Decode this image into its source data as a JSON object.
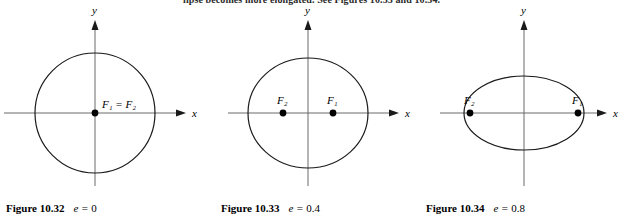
{
  "page": {
    "top_running_text": "lipse becomes more elongated. See Figures 10.33 and 10.34."
  },
  "axis": {
    "x_label": "x",
    "y_label": "y"
  },
  "figures": [
    {
      "id": "figure-10-32",
      "caption_label": "Figure 10.32",
      "eccentricity_symbol": "e =",
      "eccentricity_value": "0",
      "shape": "circle",
      "foci_label": "F₁ = F₂",
      "focus_labels": [
        "F₁ = F₂"
      ],
      "geometry": {
        "center_x": 95,
        "center_y": 113,
        "semi_major": 60,
        "semi_minor": 60,
        "foci_x": [
          95
        ],
        "focus_y": 113
      }
    },
    {
      "id": "figure-10-33",
      "caption_label": "Figure 10.33",
      "eccentricity_symbol": "e =",
      "eccentricity_value": "0.4",
      "shape": "ellipse",
      "focus_labels": [
        "F₂",
        "F₁"
      ],
      "geometry": {
        "center_x": 308,
        "center_y": 113,
        "semi_major": 60,
        "semi_minor": 55,
        "foci_x": [
          283,
          333
        ],
        "focus_y": 113
      }
    },
    {
      "id": "figure-10-34",
      "caption_label": "Figure 10.34",
      "eccentricity_symbol": "e =",
      "eccentricity_value": "0.8",
      "shape": "ellipse",
      "focus_labels": [
        "F₂",
        "F₁"
      ],
      "geometry": {
        "center_x": 524,
        "center_y": 113,
        "semi_major": 60,
        "semi_minor": 37,
        "foci_x": [
          470,
          578
        ],
        "focus_y": 113
      }
    }
  ],
  "colors": {
    "curve": "#1a1a1a",
    "axis": "#6b6b6b",
    "point": "#000000",
    "text": "#000000"
  }
}
